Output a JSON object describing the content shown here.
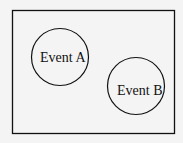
{
  "diagram": {
    "type": "venn",
    "sample_space": {
      "label": ""
    },
    "events": [
      {
        "id": "A",
        "label": "Event A"
      },
      {
        "id": "B",
        "label": "Event B"
      }
    ],
    "colors": {
      "stroke": "#111111",
      "background": "#f4f4f4"
    }
  }
}
